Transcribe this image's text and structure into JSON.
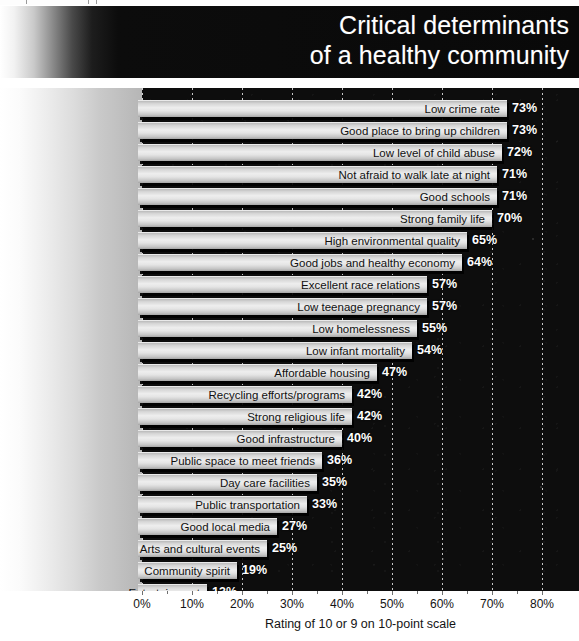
{
  "header": {
    "title_line1": "Critical determinants",
    "title_line2": "of a healthy community"
  },
  "axis": {
    "caption": "Rating of 10 or 9 on 10-point scale",
    "ticks": [
      "0%",
      "10%",
      "20%",
      "30%",
      "40%",
      "50%",
      "60%",
      "70%",
      "80%"
    ]
  },
  "colors": {
    "plot_background": "#0d0d0d",
    "bar_light": "#eeeeee",
    "bar_dark": "#a5a5a5",
    "gridline": "#e8e8e8",
    "value_text": "#ffffff",
    "label_text": "#111111"
  },
  "chart_data": {
    "type": "bar",
    "orientation": "horizontal",
    "title": "Critical determinants of a healthy community",
    "xlabel": "Rating of 10 or 9 on 10-point scale",
    "ylabel": "",
    "xlim": [
      0,
      85
    ],
    "xticks": [
      0,
      10,
      20,
      30,
      40,
      50,
      60,
      70,
      80
    ],
    "xtick_labels": [
      "0%",
      "10%",
      "20%",
      "30%",
      "40%",
      "50%",
      "60%",
      "70%",
      "80%"
    ],
    "grid": true,
    "legend": false,
    "value_suffix": "%",
    "categories": [
      "Low crime rate",
      "Good place to bring up children",
      "Low level of child abuse",
      "Not afraid to walk late at night",
      "Good schools",
      "Strong family life",
      "High environmental quality",
      "Good jobs and healthy economy",
      "Excellent race relations",
      "Low teenage pregnancy",
      "Low homelessness",
      "Low infant mortality",
      "Affordable housing",
      "Recycling efforts/programs",
      "Strong religious life",
      "Good infrastructure",
      "Public space to meet friends",
      "Day care facilities",
      "Public transportation",
      "Good local media",
      "Arts and cultural events",
      "Community spirit",
      "Entertainment"
    ],
    "values": [
      73,
      73,
      72,
      71,
      71,
      70,
      65,
      64,
      57,
      57,
      55,
      54,
      47,
      42,
      42,
      40,
      36,
      35,
      33,
      27,
      25,
      19,
      13
    ],
    "value_labels": [
      "73%",
      "73%",
      "72%",
      "71%",
      "71%",
      "70%",
      "65%",
      "64%",
      "57%",
      "57%",
      "55%",
      "54%",
      "47%",
      "42%",
      "42%",
      "40%",
      "36%",
      "35%",
      "33%",
      "27%",
      "25%",
      "19%",
      "13%"
    ]
  }
}
